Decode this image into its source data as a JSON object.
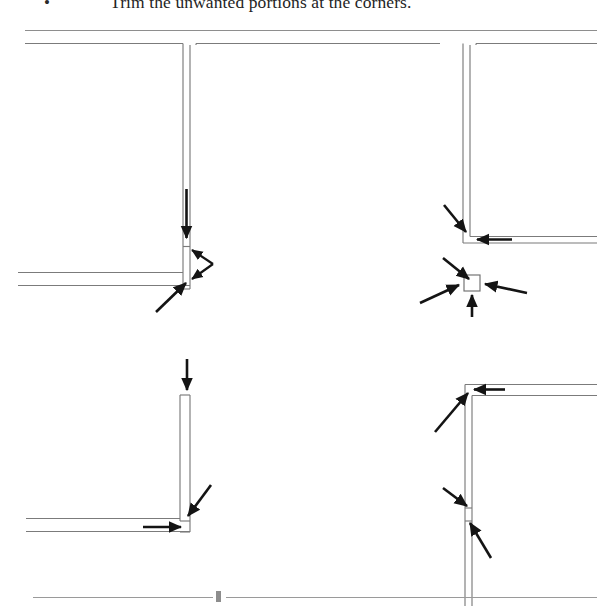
{
  "caption": {
    "bullet": "•",
    "text": "Trim the unwanted portions at the corners."
  },
  "figure": {
    "title": "Trim the unwanted portions at the corners",
    "style": {
      "line_color": "#7b7b7b",
      "annotation_color": "#141414",
      "background": "#ffffff"
    },
    "panels": [
      {
        "id": "top-left",
        "label": "T-junction with leftover stub and notch",
        "corner_type": "tee-left",
        "arrows": [
          {
            "name": "arrow-down-stub",
            "direction": "down",
            "target": "vertical leftover stub"
          },
          {
            "name": "arrow-double-left",
            "direction": "double-left-chevron",
            "target": "notch at wall intersection"
          },
          {
            "name": "arrow-diagonal-up-right",
            "direction": "up-right",
            "target": "bottom corner leftover"
          }
        ],
        "arrow_count": 3
      },
      {
        "id": "top-right",
        "label": "Corner with leftover block and detail callout",
        "corner_type": "corner-bottom-left",
        "arrows": [
          {
            "name": "arrow-diagonal-down-right",
            "direction": "down-right",
            "target": "corner junction"
          },
          {
            "name": "arrow-left-horizontal",
            "direction": "left",
            "target": "horizontal wall leftover"
          },
          {
            "name": "arrow-callout-down-right",
            "direction": "down-right",
            "target": "detail chip"
          },
          {
            "name": "arrow-callout-up-right",
            "direction": "up-right",
            "target": "detail chip"
          },
          {
            "name": "arrow-callout-left",
            "direction": "left",
            "target": "detail chip"
          },
          {
            "name": "arrow-callout-up",
            "direction": "up",
            "target": "detail chip"
          }
        ],
        "arrow_count": 6,
        "callout": {
          "name": "leftover-block-chip",
          "shape": "square"
        }
      },
      {
        "id": "bottom-left",
        "label": "Trimmed corner, arrows on remaining stubs",
        "corner_type": "corner-bottom-right",
        "arrows": [
          {
            "name": "arrow-down-top-stub",
            "direction": "down",
            "target": "top of vertical wall"
          },
          {
            "name": "arrow-diagonal-down-left",
            "direction": "down-left",
            "target": "corner junction"
          },
          {
            "name": "arrow-right-horizontal",
            "direction": "right",
            "target": "horizontal wall leftover"
          }
        ],
        "arrow_count": 3
      },
      {
        "id": "bottom-right",
        "label": "Corner and mid-wall break, four arrows",
        "corner_type": "corner-top-left",
        "arrows": [
          {
            "name": "arrow-diagonal-up-right",
            "direction": "up-right",
            "target": "top corner junction"
          },
          {
            "name": "arrow-left-horizontal",
            "direction": "left",
            "target": "top horizontal wall"
          },
          {
            "name": "arrow-diagonal-down-right-mid",
            "direction": "down-right",
            "target": "mid-wall break upper"
          },
          {
            "name": "arrow-diagonal-up-left-mid",
            "direction": "up-left",
            "target": "mid-wall break lower"
          }
        ],
        "arrow_count": 4
      }
    ],
    "totals": {
      "panel_count": 4,
      "arrow_total": 16
    }
  }
}
